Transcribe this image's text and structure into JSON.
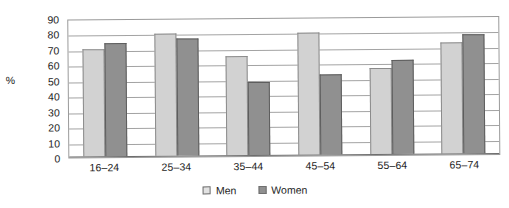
{
  "chart_data": {
    "type": "bar",
    "title": "",
    "xlabel": "",
    "ylabel": "%",
    "ylim": [
      0,
      90
    ],
    "ytick_step": 10,
    "yticks": [
      "90",
      "80",
      "70",
      "60",
      "50",
      "40",
      "30",
      "20",
      "10",
      "0"
    ],
    "grid": true,
    "legend_position": "bottom",
    "categories": [
      "16–24",
      "25–34",
      "35–44",
      "45–54",
      "55–64",
      "65–74"
    ],
    "series": [
      {
        "name": "Men",
        "color": "#d2d2d2",
        "values": [
          69,
          79,
          64,
          79,
          56,
          72
        ]
      },
      {
        "name": "Women",
        "color": "#909090",
        "values": [
          73,
          76,
          47,
          52,
          61,
          77
        ]
      }
    ]
  },
  "legend": {
    "men_label": "Men",
    "women_label": "Women"
  },
  "axis": {
    "y_unit_label": "%"
  }
}
